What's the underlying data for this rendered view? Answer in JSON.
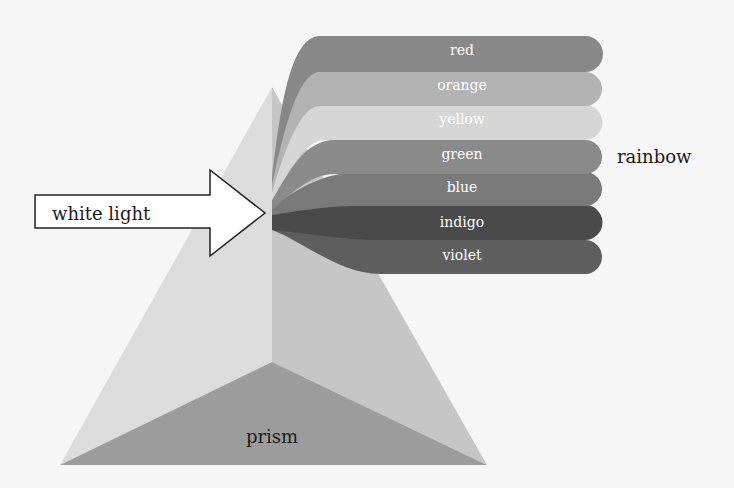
{
  "labels": {
    "input": "white light",
    "output": "rainbow",
    "object": "prism"
  },
  "bands": [
    {
      "label": "red",
      "color": "#888888"
    },
    {
      "label": "orange",
      "color": "#b2b2b2"
    },
    {
      "label": "yellow",
      "color": "#d6d6d6"
    },
    {
      "label": "green",
      "color": "#8a8a8a"
    },
    {
      "label": "blue",
      "color": "#7a7a7a"
    },
    {
      "label": "indigo",
      "color": "#4a4a4a"
    },
    {
      "label": "violet",
      "color": "#5e5e5e"
    }
  ],
  "colors": {
    "background": "#f6f6f6",
    "prism_left": "#dcdcdc",
    "prism_right": "#c4c4c4",
    "prism_base": "#9c9c9c",
    "arrow_fill": "#ffffff",
    "arrow_stroke": "#222222"
  }
}
